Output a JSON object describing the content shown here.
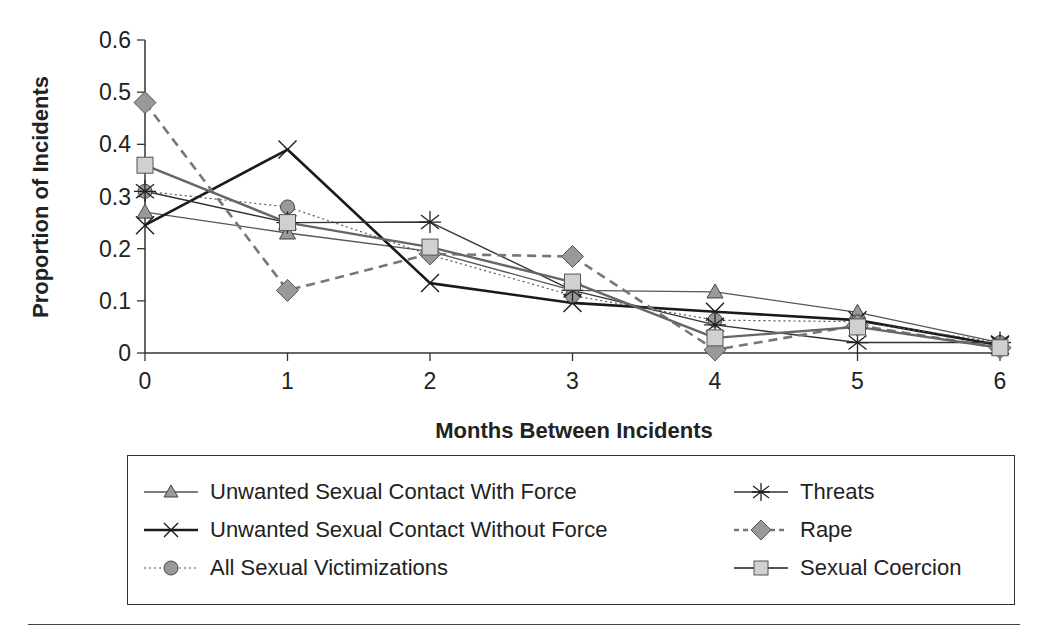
{
  "chart_data": {
    "type": "line",
    "title": "",
    "xlabel": "Months Between Incidents",
    "ylabel": "Proportion of Incidents",
    "x": [
      0,
      1,
      2,
      3,
      4,
      5,
      6
    ],
    "xticks": [
      "0",
      "1",
      "2",
      "3",
      "4",
      "5",
      "6"
    ],
    "yticks": [
      "0",
      "0.1",
      "0.2",
      "0.3",
      "0.4",
      "0.5",
      "0.6"
    ],
    "ylim": [
      0,
      0.6
    ],
    "grid": false,
    "legend_position": "bottom",
    "series": [
      {
        "name": "Unwanted Sexual Contact With Force",
        "marker": "triangle",
        "line": "thin-solid",
        "values": [
          0.27,
          0.23,
          0.195,
          0.12,
          0.117,
          0.078,
          0.02
        ]
      },
      {
        "name": "Unwanted Sexual Contact Without Force",
        "marker": "x",
        "line": "thick-solid",
        "values": [
          0.245,
          0.39,
          0.134,
          0.096,
          0.079,
          0.063,
          0.015
        ]
      },
      {
        "name": "All Sexual Victimizations",
        "marker": "circle",
        "line": "dotted",
        "values": [
          0.31,
          0.28,
          0.188,
          0.11,
          0.063,
          0.06,
          0.02
        ]
      },
      {
        "name": "Threats",
        "marker": "asterisk",
        "line": "solid",
        "values": [
          0.31,
          0.25,
          0.251,
          0.12,
          0.054,
          0.02,
          0.02
        ]
      },
      {
        "name": "Rape",
        "marker": "diamond",
        "line": "dashed",
        "values": [
          0.48,
          0.12,
          0.19,
          0.185,
          0.006,
          0.053,
          0.01
        ]
      },
      {
        "name": "Sexual Coercion",
        "marker": "square",
        "line": "medium-solid",
        "values": [
          0.36,
          0.25,
          0.203,
          0.136,
          0.029,
          0.05,
          0.01
        ]
      }
    ]
  },
  "legend": {
    "items": [
      {
        "label": "Unwanted Sexual Contact With Force"
      },
      {
        "label": "Unwanted Sexual Contact Without Force"
      },
      {
        "label": "All Sexual Victimizations"
      },
      {
        "label": "Threats"
      },
      {
        "label": "Rape"
      },
      {
        "label": "Sexual Coercion"
      }
    ]
  },
  "colors": {
    "axis": "#333333",
    "marker_fill": "#999999",
    "square_fill": "#d0d0d0",
    "dark_line": "#1a1a1a",
    "grey_line": "#555555",
    "dash_line": "#777777"
  }
}
